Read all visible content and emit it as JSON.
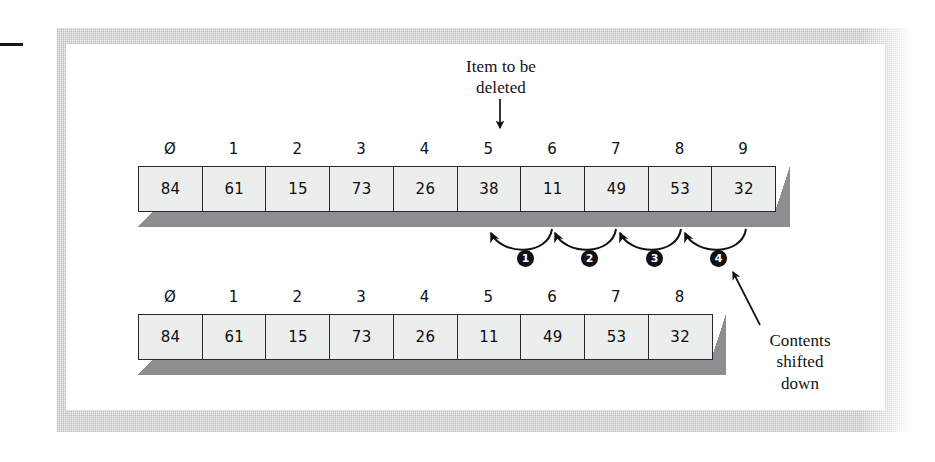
{
  "figure": {
    "kind": "array-deletion-diagram",
    "annotations": {
      "item_to_be_deleted": "Item to be\ndeleted",
      "contents_shifted_down": "Contents\nshifted\ndown"
    },
    "arrays": [
      {
        "name": "before-array",
        "indices": [
          "0",
          "1",
          "2",
          "3",
          "4",
          "5",
          "6",
          "7",
          "8",
          "9"
        ],
        "values": [
          "84",
          "61",
          "15",
          "73",
          "26",
          "38",
          "11",
          "49",
          "53",
          "32"
        ],
        "deleted_index": 5,
        "deleted_value": "38"
      },
      {
        "name": "after-array",
        "indices": [
          "0",
          "1",
          "2",
          "3",
          "4",
          "5",
          "6",
          "7",
          "8"
        ],
        "values": [
          "84",
          "61",
          "15",
          "73",
          "26",
          "11",
          "49",
          "53",
          "32"
        ]
      }
    ],
    "shift_steps": [
      "1",
      "2",
      "3",
      "4"
    ],
    "colors": {
      "cell_fill": "#eceded",
      "cell_border": "#28282c",
      "extrusion_shadow": "#8e8e90",
      "text": "#111114",
      "marker_fill": "#111114",
      "marker_text": "#ffffff",
      "page": "#ffffff"
    }
  }
}
